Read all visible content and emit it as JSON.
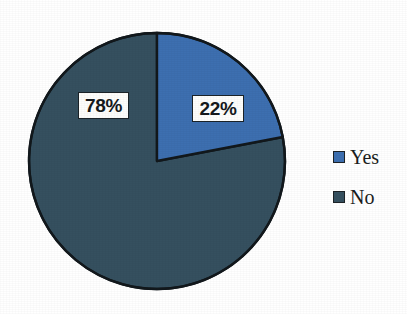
{
  "chart_data": {
    "type": "pie",
    "title": "",
    "subtitle": "",
    "xlabel": "",
    "ylabel": "",
    "grid": false,
    "legend_position": "right",
    "start_angle_deg": 0,
    "direction": "clockwise",
    "categories": [
      "Yes",
      "No"
    ],
    "values": [
      22,
      78
    ],
    "value_unit": "percent",
    "data_labels": [
      "22%",
      "78%"
    ],
    "slices": [
      {
        "name": "Yes",
        "value": 22,
        "label": "22%",
        "color": "#3d6fb0",
        "start_deg": 0,
        "sweep_deg": 79.2
      },
      {
        "name": "No",
        "value": 78,
        "label": "78%",
        "color": "#35505f",
        "start_deg": 79.2,
        "sweep_deg": 280.8
      }
    ],
    "legend": [
      {
        "label": "Yes",
        "color": "#3d6fb0",
        "swatch_icon": "square-swatch-icon"
      },
      {
        "label": "No",
        "color": "#35505f",
        "swatch_icon": "square-swatch-icon"
      }
    ],
    "colors": {
      "background": "#ffffff",
      "slice_outline": "#12181c",
      "label_box_fill": "#fdfdfb",
      "label_box_border": "#1b2328",
      "text": "#1a1d20"
    },
    "geometry": {
      "center_x": 157,
      "center_y": 161,
      "radius": 128
    }
  }
}
